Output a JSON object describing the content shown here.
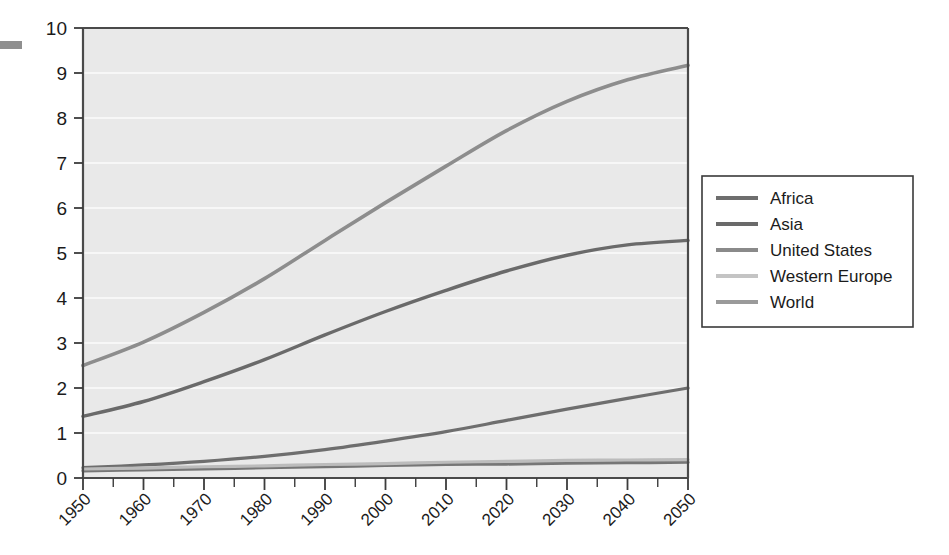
{
  "chart_data": {
    "type": "line",
    "title": "",
    "subtitle": "",
    "xlabel": "",
    "ylabel": "",
    "xlim": [
      1950,
      2050
    ],
    "ylim": [
      0,
      10
    ],
    "grid": true,
    "grid_axis": "y",
    "legend_position": "right",
    "x": [
      1950,
      1960,
      1970,
      1980,
      1990,
      2000,
      2010,
      2020,
      2030,
      2040,
      2050
    ],
    "xtick_labels": [
      "1950",
      "1960",
      "1970",
      "1980",
      "1990",
      "2000",
      "2010",
      "2020",
      "2030",
      "2040",
      "2050"
    ],
    "ytick_labels": [
      "0",
      "1",
      "2",
      "3",
      "4",
      "5",
      "6",
      "7",
      "8",
      "9",
      "10"
    ],
    "ytick_values": [
      0,
      1,
      2,
      3,
      4,
      5,
      6,
      7,
      8,
      9,
      10
    ],
    "series": [
      {
        "name": "Africa",
        "color": "#6e6e6e",
        "width": 3.2,
        "values": [
          0.23,
          0.29,
          0.37,
          0.48,
          0.63,
          0.82,
          1.03,
          1.28,
          1.53,
          1.77,
          2.0
        ]
      },
      {
        "name": "Asia",
        "color": "#6a6a6a",
        "width": 3.4,
        "values": [
          1.37,
          1.7,
          2.14,
          2.63,
          3.18,
          3.7,
          4.17,
          4.6,
          4.95,
          5.18,
          5.28
        ]
      },
      {
        "name": "United States",
        "color": "#767676",
        "width": 3.2,
        "values": [
          0.16,
          0.18,
          0.2,
          0.23,
          0.25,
          0.28,
          0.3,
          0.31,
          0.33,
          0.34,
          0.35
        ]
      },
      {
        "name": "Western Europe",
        "color": "#bcbcbc",
        "width": 3.2,
        "values": [
          0.2,
          0.22,
          0.25,
          0.27,
          0.3,
          0.32,
          0.35,
          0.37,
          0.39,
          0.4,
          0.41
        ]
      },
      {
        "name": "World",
        "color": "#8d8d8d",
        "width": 3.6,
        "values": [
          2.5,
          3.02,
          3.68,
          4.43,
          5.28,
          6.12,
          6.93,
          7.72,
          8.37,
          8.85,
          9.17
        ]
      }
    ]
  },
  "legend": {
    "items": [
      {
        "label": "Africa",
        "color": "#6e6e6e"
      },
      {
        "label": "Asia",
        "color": "#6a6a6a"
      },
      {
        "label": "United States",
        "color": "#8a8a8a"
      },
      {
        "label": "Western Europe",
        "color": "#c4c4c4"
      },
      {
        "label": "World",
        "color": "#9a9a9a"
      }
    ]
  },
  "colors": {
    "plot_background": "#e9e9e9",
    "page_background": "#ffffff",
    "gridline": "#fbfbfb",
    "axis": "#4a4a4a",
    "text": "#1b1b1b"
  }
}
